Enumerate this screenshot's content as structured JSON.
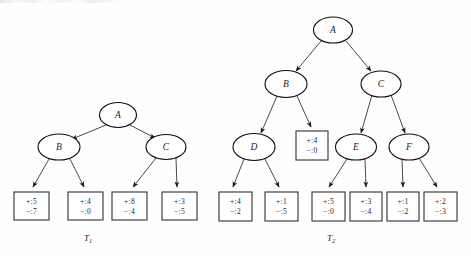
{
  "figure": {
    "background_color": "#fefefe",
    "stroke_color": "#1a1a1a",
    "leaf_stroke_color": "#3a3a3a",
    "top_artifact": "scan-edge-artifact"
  },
  "trees": [
    {
      "id": "T1",
      "caption": "T",
      "caption_subscript": "1",
      "caption_x": 88,
      "caption_y": 241,
      "nodes": [
        {
          "name": "node-a",
          "label": "A",
          "cx": 118,
          "cy": 115,
          "rx": 18.5,
          "ry": 12.5
        },
        {
          "name": "node-b",
          "label": "B",
          "cx": 59,
          "cy": 147,
          "rx": 21.0,
          "ry": 13.0
        },
        {
          "name": "node-c",
          "label": "C",
          "cx": 166,
          "cy": 147,
          "rx": 20.0,
          "ry": 12.5
        }
      ],
      "leaves": [
        {
          "name": "leaf-b-left",
          "plus": "+:5",
          "minus": "−:0",
          "plus_text": "+:5",
          "minus_text": "−:7",
          "x": 14,
          "y": 192,
          "w": 35,
          "h": 28
        },
        {
          "name": "leaf-b-right",
          "plus_text": "+:4",
          "minus_text": "−:0",
          "x": 68,
          "y": 192,
          "w": 35,
          "h": 28
        },
        {
          "name": "leaf-c-left",
          "plus_text": "+:8",
          "minus_text": "−:4",
          "x": 112,
          "y": 192,
          "w": 35,
          "h": 28
        },
        {
          "name": "leaf-c-right",
          "plus_text": "+:3",
          "minus_text": "−:5",
          "x": 162,
          "y": 192,
          "w": 35,
          "h": 28
        }
      ],
      "edges": [
        {
          "name": "edge-a-b",
          "from": "A",
          "to": "B"
        },
        {
          "name": "edge-a-c",
          "from": "A",
          "to": "C"
        },
        {
          "name": "edge-b-leaf1",
          "from": "B",
          "to": "leaf-b-left"
        },
        {
          "name": "edge-b-leaf2",
          "from": "B",
          "to": "leaf-b-right"
        },
        {
          "name": "edge-c-leaf1",
          "from": "C",
          "to": "leaf-c-left"
        },
        {
          "name": "edge-c-leaf2",
          "from": "C",
          "to": "leaf-c-right"
        }
      ]
    },
    {
      "id": "T2",
      "caption": "T",
      "caption_subscript": "2",
      "caption_x": 331,
      "caption_y": 241,
      "nodes": [
        {
          "name": "node-a",
          "label": "A",
          "cx": 333,
          "cy": 30,
          "rx": 19.5,
          "ry": 13.0
        },
        {
          "name": "node-b",
          "label": "B",
          "cx": 286,
          "cy": 84,
          "rx": 21.0,
          "ry": 13.5
        },
        {
          "name": "node-c",
          "label": "C",
          "cx": 381,
          "cy": 84,
          "rx": 20.0,
          "ry": 13.0
        },
        {
          "name": "node-d",
          "label": "D",
          "cx": 254,
          "cy": 147,
          "rx": 21.0,
          "ry": 13.5
        },
        {
          "name": "node-e",
          "label": "E",
          "cx": 356,
          "cy": 147,
          "rx": 20.5,
          "ry": 13.0
        },
        {
          "name": "node-f",
          "label": "F",
          "cx": 409,
          "cy": 147,
          "rx": 20.0,
          "ry": 13.0
        }
      ],
      "leaves": [
        {
          "name": "leaf-b-right",
          "plus_text": "+:4",
          "minus_text": "−:0",
          "x": 296,
          "y": 131,
          "w": 32,
          "h": 29
        },
        {
          "name": "leaf-d-left",
          "plus_text": "+:4",
          "minus_text": "−:2",
          "x": 219,
          "y": 192,
          "w": 33,
          "h": 29
        },
        {
          "name": "leaf-d-right",
          "plus_text": "+:1",
          "minus_text": "−:5",
          "x": 265,
          "y": 192,
          "w": 33,
          "h": 29
        },
        {
          "name": "leaf-e-left",
          "plus_text": "+:5",
          "minus_text": "−:0",
          "x": 312,
          "y": 192,
          "w": 33,
          "h": 29
        },
        {
          "name": "leaf-e-right",
          "plus_text": "+:3",
          "minus_text": "−:4",
          "x": 350,
          "y": 192,
          "w": 32,
          "h": 29
        },
        {
          "name": "leaf-f-left",
          "plus_text": "+:1",
          "minus_text": "−:2",
          "x": 387,
          "y": 192,
          "w": 32,
          "h": 29
        },
        {
          "name": "leaf-f-right",
          "plus_text": "+:2",
          "minus_text": "−:3",
          "x": 424,
          "y": 192,
          "w": 33,
          "h": 29
        }
      ],
      "edges": [
        {
          "name": "edge-a-b",
          "from": "A",
          "to": "B"
        },
        {
          "name": "edge-a-c",
          "from": "A",
          "to": "C"
        },
        {
          "name": "edge-b-d",
          "from": "B",
          "to": "D"
        },
        {
          "name": "edge-b-leaf",
          "from": "B",
          "to": "leaf-b-right"
        },
        {
          "name": "edge-c-e",
          "from": "C",
          "to": "E"
        },
        {
          "name": "edge-c-f",
          "from": "C",
          "to": "F"
        },
        {
          "name": "edge-d-leaf1",
          "from": "D",
          "to": "leaf-d-left"
        },
        {
          "name": "edge-d-leaf2",
          "from": "D",
          "to": "leaf-d-right"
        },
        {
          "name": "edge-e-leaf1",
          "from": "E",
          "to": "leaf-e-left"
        },
        {
          "name": "edge-e-leaf2",
          "from": "E",
          "to": "leaf-e-right"
        },
        {
          "name": "edge-f-leaf1",
          "from": "F",
          "to": "leaf-f-left"
        },
        {
          "name": "edge-f-leaf2",
          "from": "F",
          "to": "leaf-f-right"
        }
      ]
    }
  ]
}
